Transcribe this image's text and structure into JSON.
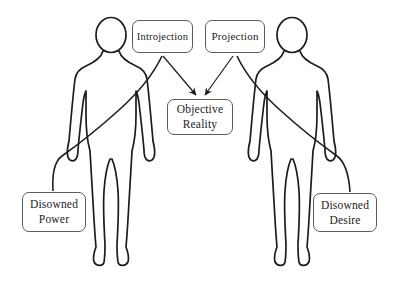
{
  "diagram": {
    "background_color": "#ffffff",
    "figure_stroke_color": "#1c1c1c",
    "connector_color": "#1c1c1c",
    "box_border_color": "#5c5c5c",
    "text_color": "#1b1b1b",
    "nodes": {
      "introjection": {
        "label": "Introjection"
      },
      "projection": {
        "label": "Projection"
      },
      "objective_reality": {
        "line1": "Objective",
        "line2": "Reality"
      },
      "disowned_power": {
        "line1": "Disowned",
        "line2": "Power"
      },
      "disowned_desire": {
        "line1": "Disowned",
        "line2": "Desire"
      }
    },
    "figures": [
      {
        "name": "left-person",
        "type": "human-body-outline"
      },
      {
        "name": "right-person",
        "type": "human-body-outline"
      }
    ],
    "edges": [
      {
        "from": "introjection",
        "to": "objective_reality",
        "style": "straight-arrow"
      },
      {
        "from": "projection",
        "to": "objective_reality",
        "style": "straight-arrow"
      },
      {
        "from": "introjection",
        "to": "disowned_power",
        "style": "sweeping-curve-across-left-figure"
      },
      {
        "from": "projection",
        "to": "disowned_desire",
        "style": "sweeping-curve-across-right-figure"
      }
    ]
  }
}
